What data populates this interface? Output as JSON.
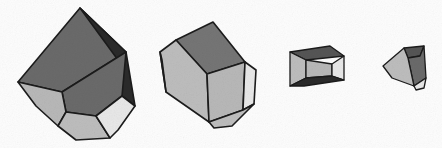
{
  "figure": {
    "title": "Polyhedral block shown at four decreasing scales",
    "background_color": "#fdfdfd",
    "outline_color": "#1b1b1b",
    "canvas": {
      "width": 442,
      "height": 148
    }
  },
  "palette": {
    "outline": "#1b1b1b",
    "face_darkest": "#2a2a2a",
    "face_dark": "#555555",
    "face_mid_dark": "#6a6a6a",
    "face_mid": "#757575",
    "face_light": "#b8b8b8",
    "face_lighter": "#bdbdbd",
    "face_lightest": "#e8e8e8",
    "face_pale": "#d5d5d5",
    "background": "#fdfdfd"
  },
  "shapes": [
    {
      "name": "block-1",
      "label": "Largest block",
      "order": 1,
      "relative_scale": 1.0,
      "bounds": {
        "x": 14,
        "y": 6,
        "width": 132,
        "height": 136
      },
      "faces": [
        {
          "name": "top-left-face",
          "tone": "mid-dark",
          "color": "#6a6a6a",
          "points": "80,8 18,82 62,92 126,52"
        },
        {
          "name": "right-face",
          "tone": "darkest",
          "color": "#2a2a2a",
          "points": "80,8 126,52 135,106 122,96 118,60"
        },
        {
          "name": "front-large-face",
          "tone": "mid-dark",
          "color": "#6a6a6a",
          "points": "62,92 126,52 122,96 96,116 66,112"
        },
        {
          "name": "lower-left-face",
          "tone": "light",
          "color": "#b8b8b8",
          "points": "18,82 62,92 66,112 58,126 36,106"
        },
        {
          "name": "bottom-front-face",
          "tone": "light",
          "color": "#bdbdbd",
          "points": "58,126 66,112 96,116 110,138 76,140"
        },
        {
          "name": "bottom-right-face",
          "tone": "lightest",
          "color": "#e8e8e8",
          "points": "96,116 122,96 135,106 118,130 110,138"
        }
      ]
    },
    {
      "name": "block-2",
      "label": "Second block",
      "order": 2,
      "relative_scale": 0.72,
      "bounds": {
        "x": 155,
        "y": 18,
        "width": 105,
        "height": 112
      },
      "faces": [
        {
          "name": "top-face",
          "tone": "mid",
          "color": "#757575",
          "points": "176,40 213,22 245,62 207,74"
        },
        {
          "name": "left-front-face",
          "tone": "light",
          "color": "#bdbdbd",
          "points": "160,52 176,40 207,74 209,122 166,92"
        },
        {
          "name": "front-lower-face",
          "tone": "light",
          "color": "#b8b8b8",
          "points": "207,74 245,62 243,110 209,122"
        },
        {
          "name": "left-sliver-face",
          "tone": "pale",
          "color": "#d5d5d5",
          "points": "160,52 166,92 162,60"
        },
        {
          "name": "right-face",
          "tone": "lightest",
          "color": "#e8e8e8",
          "points": "245,62 256,70 254,104 243,110"
        },
        {
          "name": "bottom-face",
          "tone": "light",
          "color": "#bdbdbd",
          "points": "209,122 243,110 254,104 232,126 214,128"
        }
      ]
    },
    {
      "name": "block-3",
      "label": "Third block, edge-on view",
      "order": 3,
      "relative_scale": 0.44,
      "bounds": {
        "x": 288,
        "y": 44,
        "width": 62,
        "height": 46
      },
      "faces": [
        {
          "name": "top-face",
          "tone": "dark",
          "color": "#555555",
          "points": "290,52 330,46 344,56 306,60"
        },
        {
          "name": "front-face",
          "tone": "light",
          "color": "#bdbdbd",
          "points": "290,52 306,60 306,78 290,86"
        },
        {
          "name": "front-large-face",
          "tone": "light",
          "color": "#b8b8b8",
          "points": "306,60 332,64 332,76 306,78"
        },
        {
          "name": "right-end-face",
          "tone": "lightest",
          "color": "#e8e8e8",
          "points": "332,64 344,56 344,80 332,76"
        },
        {
          "name": "bottom-face",
          "tone": "darkest",
          "color": "#2a2a2a",
          "points": "290,86 306,78 332,76 344,80 304,86"
        }
      ]
    },
    {
      "name": "block-4",
      "label": "Smallest block",
      "order": 4,
      "relative_scale": 0.3,
      "bounds": {
        "x": 381,
        "y": 44,
        "width": 48,
        "height": 46
      },
      "faces": [
        {
          "name": "top-face",
          "tone": "dark",
          "color": "#555555",
          "points": "404,48 424,46 420,56 408,58"
        },
        {
          "name": "right-face",
          "tone": "mid-dark",
          "color": "#6a6a6a",
          "points": "408,58 420,56 424,46 426,78 414,86"
        },
        {
          "name": "left-front-face",
          "tone": "light",
          "color": "#bdbdbd",
          "points": "383,66 404,48 408,58 414,86 392,78"
        },
        {
          "name": "bottom-face",
          "tone": "lightest",
          "color": "#e8e8e8",
          "points": "414,86 426,78 424,88 416,90"
        }
      ]
    }
  ]
}
